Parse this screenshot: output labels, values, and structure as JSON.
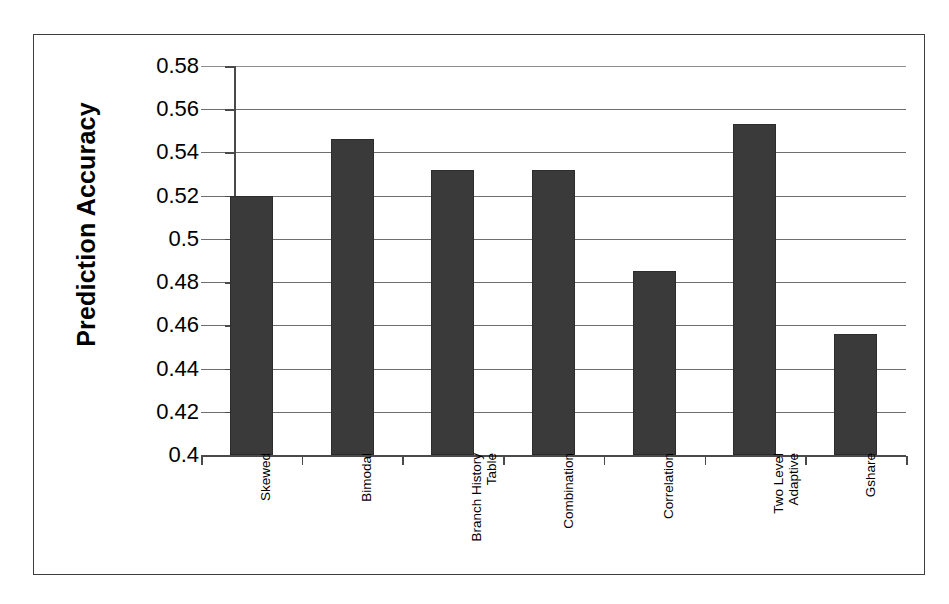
{
  "chart_data": {
    "type": "bar",
    "title": "",
    "xlabel": "",
    "ylabel": "Prediction Accuracy",
    "ylim": [
      0.4,
      0.58
    ],
    "ytick_step": 0.02,
    "ytick_labels": [
      "0.58",
      "0.56",
      "0.54",
      "0.52",
      "0.5",
      "0.48",
      "0.46",
      "0.44",
      "0.42",
      "0.4"
    ],
    "ytick_values": [
      0.58,
      0.56,
      0.54,
      0.52,
      0.5,
      0.48,
      0.46,
      0.44,
      0.42,
      0.4
    ],
    "categories": [
      "Skewed",
      "Bimodal",
      "Branch History\nTable",
      "Combination",
      "Correlation",
      "Two Level\nAdaptive",
      "Gshare"
    ],
    "values": [
      0.52,
      0.546,
      0.532,
      0.532,
      0.485,
      0.553,
      0.456
    ],
    "grid": true,
    "grid_axis": "y",
    "legend": false,
    "legend_position": "none",
    "bar_color": "#3a3a3a",
    "background_color": "#ffffff",
    "frame_color": "#3d3d3d",
    "gridline_color": "#6e6e6e",
    "axis_color": "#4a4a4a"
  }
}
